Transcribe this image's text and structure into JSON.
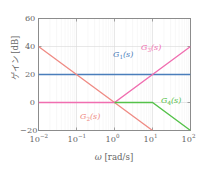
{
  "chart_data": {
    "type": "line",
    "title": "",
    "subtitle": "",
    "xlabel": "ω [rad/s]",
    "ylabel": "ゲイン [dB]",
    "xscale": "log",
    "yscale": "linear",
    "xlim": [
      0.01,
      100
    ],
    "ylim": [
      -20,
      60
    ],
    "grid": true,
    "legend_position": "inline-annotations",
    "xticks": [
      {
        "value": 0.01,
        "label": "10",
        "exp": "−2"
      },
      {
        "value": 0.1,
        "label": "10",
        "exp": "−1"
      },
      {
        "value": 1,
        "label": "10",
        "exp": "0"
      },
      {
        "value": 10,
        "label": "10",
        "exp": "1"
      },
      {
        "value": 100,
        "label": "10",
        "exp": "2"
      }
    ],
    "yticks": [
      {
        "value": 60,
        "label": "60"
      },
      {
        "value": 40,
        "label": "40"
      },
      {
        "value": 20,
        "label": "20"
      },
      {
        "value": 0,
        "label": "0"
      },
      {
        "value": -20,
        "label": "−20"
      }
    ],
    "series": [
      {
        "name": "G1",
        "label": "G",
        "sub": "1",
        "suffix": "(s)",
        "color": "#4a7ebb",
        "points": [
          {
            "x": 0.01,
            "y": 20
          },
          {
            "x": 100,
            "y": 20
          }
        ]
      },
      {
        "name": "G2",
        "label": "G",
        "sub": "2",
        "suffix": "(s)",
        "color": "#ef8a83",
        "points": [
          {
            "x": 0.01,
            "y": 40
          },
          {
            "x": 10,
            "y": -20
          }
        ]
      },
      {
        "name": "G3",
        "label": "G",
        "sub": "3",
        "suffix": "(s)",
        "color": "#f06eb0",
        "points": [
          {
            "x": 0.01,
            "y": 0
          },
          {
            "x": 1,
            "y": 0
          },
          {
            "x": 100,
            "y": 40
          }
        ]
      },
      {
        "name": "G4",
        "label": "G",
        "sub": "4",
        "suffix": "(s)",
        "color": "#55c24a",
        "points": [
          {
            "x": 1,
            "y": 0
          },
          {
            "x": 10,
            "y": 0
          },
          {
            "x": 100,
            "y": -20
          }
        ]
      }
    ],
    "annotations": [
      {
        "series": "G1",
        "text_main": "G",
        "text_sub": "1",
        "text_tail": "(s)",
        "x_px": 113,
        "y_px": 51,
        "color": "#4a7ebb"
      },
      {
        "series": "G3",
        "text_main": "G",
        "text_sub": "3",
        "text_tail": "(s)",
        "x_px": 141,
        "y_px": 44,
        "color": "#f06eb0"
      },
      {
        "series": "G2",
        "text_main": "G",
        "text_sub": "2",
        "text_tail": "(s)",
        "x_px": 80,
        "y_px": 113,
        "color": "#ef8a83"
      },
      {
        "series": "G4",
        "text_main": "G",
        "text_sub": "4",
        "text_tail": "(s)",
        "x_px": 161,
        "y_px": 97,
        "color": "#55c24a"
      }
    ]
  },
  "axes": {
    "xlabel_sym": "ω",
    "xlabel_unit": "[rad/s]",
    "ylabel_text": "ゲイン [dB]"
  },
  "style": {
    "axis_color": "#8c8c8c",
    "grid_color": "#d9d9d9",
    "text_color": "#666666",
    "background": "#ffffff"
  }
}
